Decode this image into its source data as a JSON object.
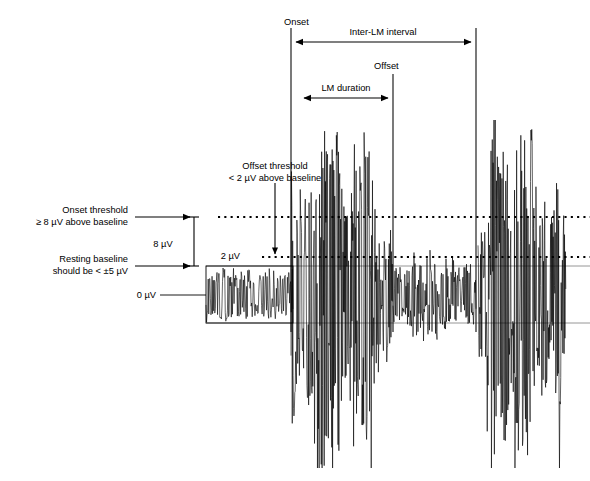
{
  "figure": {
    "type": "annotated-emg-waveform-diagram",
    "title": "",
    "background_color": "#ffffff",
    "trace_color": "#000000",
    "annotation_color": "#000000"
  },
  "annotations": {
    "onset_label": "Onset",
    "offset_label": "Offset",
    "inter_lm_label": "Inter-LM interval",
    "lm_duration_label": "LM duration",
    "onset_threshold_line1": "Onset threshold",
    "onset_threshold_line2": "≥ 8 µV above baseline",
    "offset_threshold_line1": "Offset threshold",
    "offset_threshold_line2": "< 2 µV above baseline",
    "resting_baseline_line1": "Resting baseline",
    "resting_baseline_line2": "should be < ±5 µV",
    "scale_8uv": "8 µV",
    "scale_2uv": "2 µV",
    "scale_0uv": "0 µV"
  },
  "chart_data": {
    "type": "line",
    "xlabel": "",
    "ylabel": "",
    "grid": false,
    "legend": null,
    "thresholds": [
      {
        "name": "onset-threshold",
        "value_uv": 8,
        "comparator": "≥",
        "style": "dotted",
        "y_px": 217,
        "x_start_px": 218,
        "x_end_px": 590
      },
      {
        "name": "offset-threshold",
        "value_uv": 2,
        "comparator": "<",
        "style": "dotted",
        "y_px": 257,
        "x_start_px": 262,
        "x_end_px": 590
      },
      {
        "name": "baseline-zero",
        "value_uv": 0,
        "comparator": "=",
        "style": "solid",
        "y_px": 295,
        "x_start_px": 206,
        "x_end_px": 590
      }
    ],
    "event_markers": [
      {
        "name": "onset",
        "label": "Onset",
        "x_px": 291,
        "y_top_px": 28,
        "y_bottom_px": 330
      },
      {
        "name": "offset",
        "label": "Offset",
        "x_px": 393,
        "y_top_px": 74,
        "y_bottom_px": 330
      },
      {
        "name": "next-onset",
        "label": "",
        "x_px": 476,
        "y_top_px": 28,
        "y_bottom_px": 330
      }
    ],
    "measurements": [
      {
        "name": "inter-lm-interval",
        "label": "Inter-LM interval",
        "x_start_px": 294,
        "x_end_px": 473,
        "y_px": 42
      },
      {
        "name": "lm-duration",
        "label": "LM duration",
        "x_start_px": 302,
        "x_end_px": 390,
        "y_px": 98
      },
      {
        "name": "amplitude-8uv",
        "label": "8 µV",
        "y_start_px": 217,
        "y_end_px": 266,
        "x_px": 194
      }
    ],
    "segments": [
      {
        "name": "resting-baseline",
        "x_start_px": 206,
        "x_end_px": 293,
        "amplitude_uv": 5,
        "description": "low amplitude resting baseline inside box"
      },
      {
        "name": "leg-movement-burst-1",
        "x_start_px": 291,
        "x_end_px": 393,
        "amplitude_uv": 30,
        "description": "large amplitude limb movement burst"
      },
      {
        "name": "sub-threshold-activity",
        "x_start_px": 393,
        "x_end_px": 476,
        "amplitude_uv": 7,
        "description": "activity below onset threshold"
      },
      {
        "name": "leg-movement-burst-2",
        "x_start_px": 478,
        "x_end_px": 566,
        "amplitude_uv": 30,
        "description": "second limb movement burst"
      }
    ],
    "baseline_box": {
      "x_px": 206,
      "y_px": 266,
      "width_px": 87,
      "height_px": 57
    }
  }
}
